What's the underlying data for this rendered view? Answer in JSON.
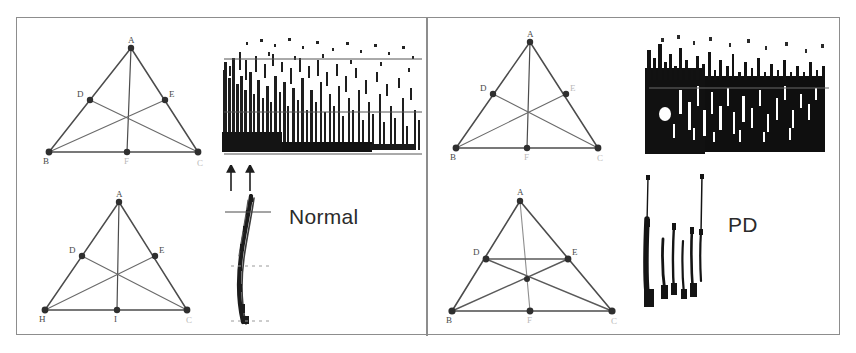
{
  "figure": {
    "background_color": "#ffffff",
    "frame_color": "#8d8d8d",
    "ink_color": "#3a3a3a",
    "label_color": "#4a4a4a"
  },
  "panels": [
    {
      "id": "normal",
      "caption": "Normal",
      "diagrams": [
        {
          "id": "normal-top-triangle",
          "name": "triangle-diagram-normal-upper",
          "vertices": [
            {
              "label": "A",
              "role": "apex"
            },
            {
              "label": "D",
              "role": "left-side-midpoint"
            },
            {
              "label": "E",
              "role": "right-side-midpoint"
            },
            {
              "label": "B",
              "role": "bottom-left"
            },
            {
              "label": "F",
              "role": "bottom-midpoint"
            },
            {
              "label": "C",
              "role": "bottom-right"
            }
          ]
        },
        {
          "id": "normal-bottom-triangle",
          "name": "triangle-diagram-normal-lower",
          "vertices": [
            {
              "label": "A",
              "role": "apex"
            },
            {
              "label": "D",
              "role": "left-side-midpoint"
            },
            {
              "label": "E",
              "role": "right-side-midpoint"
            },
            {
              "label": "H",
              "role": "bottom-left"
            },
            {
              "label": "I",
              "role": "bottom-midpoint"
            },
            {
              "label": "C",
              "role": "bottom-right"
            }
          ]
        }
      ],
      "traces": [
        {
          "id": "normal-emg-trace",
          "name": "emg-recording-normal",
          "kind": "dense-noise-block",
          "density": "moderate",
          "reference_lines": 3
        },
        {
          "id": "normal-spiral-trace",
          "name": "handwriting-trace-normal",
          "kind": "vertical-stroke",
          "strokes": 1
        }
      ],
      "markers": {
        "arrow_count": 2,
        "arrow_direction": "up"
      }
    },
    {
      "id": "pd",
      "caption": "PD",
      "diagrams": [
        {
          "id": "pd-top-triangle",
          "name": "triangle-diagram-pd-upper",
          "vertices": [
            {
              "label": "A",
              "role": "apex"
            },
            {
              "label": "D",
              "role": "left-side-midpoint"
            },
            {
              "label": "E",
              "role": "right-side-midpoint"
            },
            {
              "label": "B",
              "role": "bottom-left"
            },
            {
              "label": "F",
              "role": "bottom-midpoint"
            },
            {
              "label": "C",
              "role": "bottom-right"
            }
          ]
        },
        {
          "id": "pd-bottom-triangle",
          "name": "triangle-diagram-pd-lower",
          "vertices": [
            {
              "label": "A",
              "role": "apex"
            },
            {
              "label": "D",
              "role": "left-side-midpoint"
            },
            {
              "label": "E",
              "role": "right-side-midpoint"
            },
            {
              "label": "B",
              "role": "bottom-left"
            },
            {
              "label": "F",
              "role": "bottom-midpoint"
            },
            {
              "label": "C",
              "role": "bottom-right"
            }
          ]
        }
      ],
      "traces": [
        {
          "id": "pd-emg-trace",
          "name": "emg-recording-pd",
          "kind": "dense-noise-block",
          "density": "high",
          "reference_lines": 1
        },
        {
          "id": "pd-spiral-trace",
          "name": "handwriting-trace-pd",
          "kind": "vertical-stroke",
          "strokes": 5
        }
      ],
      "markers": {
        "arrow_count": 0,
        "arrow_direction": ""
      }
    }
  ]
}
